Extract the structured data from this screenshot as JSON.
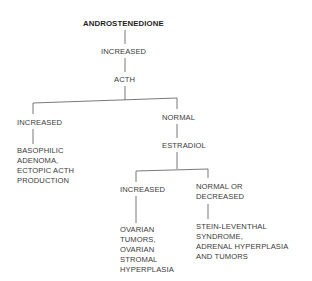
{
  "diagram": {
    "root": "ANDROSTENEDIONE",
    "level1": "INCREASED",
    "level2": "ACTH",
    "acth_branches": {
      "left": {
        "label": "INCREASED",
        "result": [
          "BASOPHILIC",
          "ADENOMA,",
          "ECTOPIC ACTH",
          "PRODUCTION"
        ]
      },
      "right": {
        "label": "NORMAL",
        "next": "ESTRADIOL"
      }
    },
    "estradiol_branches": {
      "left": {
        "label": "INCREASED",
        "result": [
          "OVARIAN",
          "TUMORS,",
          "OVARIAN",
          "STROMAL",
          "HYPERPLASIA"
        ]
      },
      "right": {
        "label": [
          "NORMAL OR",
          "DECREASED"
        ],
        "result": [
          "STEIN-LEVENTHAL",
          "SYNDROME,",
          "ADRENAL HYPERPLASIA",
          "AND TUMORS"
        ]
      }
    }
  }
}
